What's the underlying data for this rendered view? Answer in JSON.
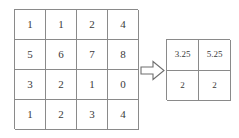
{
  "diagram": {
    "type": "matrix-transformation",
    "input_matrix": {
      "name": "input-matrix",
      "rows": 4,
      "cols": 4,
      "values": [
        [
          "1",
          "1",
          "2",
          "4"
        ],
        [
          "5",
          "6",
          "7",
          "8"
        ],
        [
          "3",
          "2",
          "1",
          "0"
        ],
        [
          "1",
          "2",
          "3",
          "4"
        ]
      ]
    },
    "arrow": {
      "name": "transform-arrow",
      "direction": "right",
      "style": "block-outline"
    },
    "output_matrix": {
      "name": "output-matrix",
      "rows": 2,
      "cols": 2,
      "values": [
        [
          "3.25",
          "5.25"
        ],
        [
          "2",
          "2"
        ]
      ]
    }
  },
  "colors": {
    "grid_line": "#8a8a8a",
    "text": "#3a3a3a",
    "background": "#ffffff",
    "arrow_stroke": "#6e6e6e"
  }
}
